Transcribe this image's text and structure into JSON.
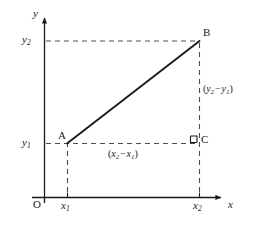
{
  "figure": {
    "type": "coordinate-geometry-diagram",
    "background_color": "#ffffff",
    "ink_color": "#1a1a1a",
    "axes": {
      "x_axis_label": "x",
      "y_axis_label": "y",
      "origin_label": "O",
      "x_ticks": [
        {
          "id": "x1",
          "text_main": "x",
          "text_sub": "1"
        },
        {
          "id": "x2",
          "text_main": "x",
          "text_sub": "2"
        }
      ],
      "y_ticks": [
        {
          "id": "y1",
          "text_main": "y",
          "text_sub": "1"
        },
        {
          "id": "y2",
          "text_main": "y",
          "text_sub": "2"
        }
      ]
    },
    "points": [
      {
        "id": "A",
        "label": "A",
        "x": 67,
        "y": 143
      },
      {
        "id": "B",
        "label": "B",
        "x": 199,
        "y": 41
      },
      {
        "id": "C",
        "label": "C",
        "x": 199,
        "y": 143
      }
    ],
    "segments": [
      {
        "id": "AB",
        "from": "A",
        "to": "B",
        "style": "solid"
      },
      {
        "id": "AC",
        "from": "A",
        "to": "C",
        "style": "dashed"
      },
      {
        "id": "BC",
        "from": "B",
        "to": "C",
        "style": "dashed"
      }
    ],
    "annotations": {
      "horizontal_leg": {
        "open": "(",
        "first": "x",
        "first_sub": "2",
        "minus": "−",
        "second": "x",
        "second_sub": "1",
        "close": ")"
      },
      "vertical_leg": {
        "open": "(",
        "first": "y",
        "first_sub": "2",
        "minus": "−",
        "second": "y",
        "second_sub": "1",
        "close": ")"
      },
      "right_angle_marker": {
        "at": "C",
        "shown": true
      }
    }
  }
}
